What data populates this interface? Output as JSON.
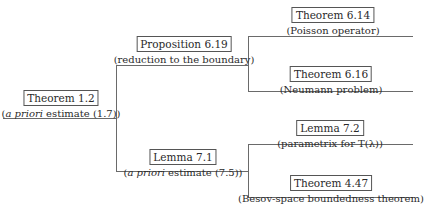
{
  "diagram": {
    "root": {
      "title": "Theorem 1.2",
      "subtitle_italic": "a priori",
      "subtitle_rest": " estimate (1.7))",
      "subtitle_open": "("
    },
    "branch_upper": {
      "title": "Proposition 6.19",
      "subtitle": "(reduction to the boundary)",
      "children": [
        {
          "title": "Theorem 6.14",
          "subtitle": "(Poisson operator)"
        },
        {
          "title": "Theorem 6.16",
          "subtitle": "(Neumann problem)"
        }
      ]
    },
    "branch_lower": {
      "title": "Lemma 7.1",
      "subtitle_open": "(",
      "subtitle_italic": "a priori",
      "subtitle_rest": " estimate (7.5))",
      "children": [
        {
          "title": "Lemma 7.2",
          "subtitle": "(parametrix for T(λ))"
        },
        {
          "title": "Theorem 4.47",
          "subtitle": "(Besov-space boundedness theorem)"
        }
      ]
    },
    "colors": {
      "line": "#6a6a6a",
      "text": "#2a2a2a",
      "box_border": "#555555"
    }
  }
}
